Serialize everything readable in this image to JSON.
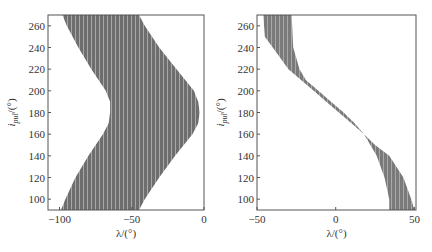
{
  "chart_data": [
    {
      "type": "area",
      "title": "",
      "xlabel": "λ/(°)",
      "ylabel": "i_pul/(°)",
      "xlim": [
        -108,
        0
      ],
      "ylim": [
        90,
        270
      ],
      "xticks": [
        -100,
        -50,
        0
      ],
      "yticks": [
        100,
        120,
        140,
        160,
        180,
        200,
        220,
        240,
        260
      ],
      "grid": false,
      "fill_color": "#6e6e6e",
      "description": "Feasible region (shaded band) bounded by left and right curves",
      "series": [
        {
          "name": "left boundary",
          "y": [
            90,
            100,
            120,
            140,
            160,
            170,
            180,
            190,
            200,
            220,
            240,
            260,
            270
          ],
          "x": [
            -99,
            -96,
            -89,
            -80,
            -70,
            -66,
            -65,
            -65,
            -68,
            -78,
            -87,
            -95,
            -98
          ]
        },
        {
          "name": "right boundary",
          "y": [
            90,
            100,
            120,
            140,
            160,
            170,
            180,
            190,
            200,
            220,
            240,
            260,
            270
          ],
          "x": [
            -45,
            -41,
            -31,
            -20,
            -8,
            -4,
            -3,
            -4,
            -7,
            -19,
            -31,
            -41,
            -45
          ]
        }
      ]
    },
    {
      "type": "area",
      "title": "",
      "xlabel": "λ/(°)",
      "ylabel": "i_pul/(°)",
      "xlim": [
        -50,
        51
      ],
      "ylim": [
        90,
        270
      ],
      "xticks": [
        -50,
        0,
        50
      ],
      "yticks": [
        100,
        120,
        140,
        160,
        180,
        200,
        220,
        240,
        260
      ],
      "grid": false,
      "fill_color": "#7a7a7a",
      "description": "Feasible region (S-shaped shaded band)",
      "series": [
        {
          "name": "left boundary",
          "y": [
            90,
            100,
            120,
            140,
            160,
            170,
            180,
            190,
            200,
            210,
            220,
            240,
            250,
            270
          ],
          "x": [
            34,
            34,
            31,
            26,
            18,
            10,
            2,
            -6,
            -14,
            -22,
            -30,
            -40,
            -45,
            -46
          ]
        },
        {
          "name": "right boundary",
          "y": [
            90,
            100,
            120,
            140,
            150,
            160,
            170,
            180,
            190,
            200,
            210,
            220,
            240,
            270
          ],
          "x": [
            50,
            48,
            43,
            34,
            25,
            18,
            12,
            5,
            -3,
            -11,
            -19,
            -23,
            -27,
            -28
          ]
        }
      ]
    }
  ],
  "panels": [
    {
      "xlabel": "λ/(°)",
      "ylabel_main": "i",
      "ylabel_sub": "pul",
      "ylabel_unit": "/(°)",
      "xtick_labels": [
        "−100",
        "−50",
        "0"
      ],
      "ytick_labels": [
        "100",
        "120",
        "140",
        "160",
        "180",
        "200",
        "220",
        "240",
        "260"
      ]
    },
    {
      "xlabel": "λ/(°)",
      "ylabel_main": "i",
      "ylabel_sub": "pul",
      "ylabel_unit": "/(°)",
      "xtick_labels": [
        "−50",
        "0",
        "50"
      ],
      "ytick_labels": [
        "100",
        "120",
        "140",
        "160",
        "180",
        "200",
        "220",
        "240",
        "260"
      ]
    }
  ]
}
